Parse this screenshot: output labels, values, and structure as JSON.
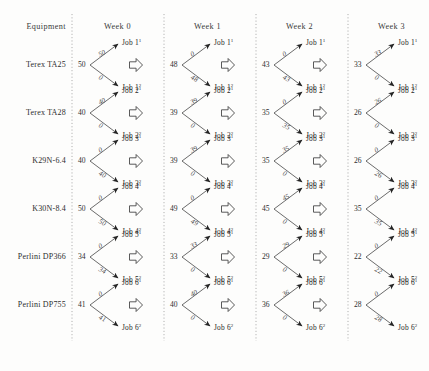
{
  "figure": {
    "type": "multi-stage-allocation-diagram",
    "columns": [
      "Equipment",
      "Week 0",
      "Week 1",
      "Week 2",
      "Week 3"
    ],
    "equipment_header": "Equipment",
    "week_headers": [
      "Week 0",
      "Week 1",
      "Week 2",
      "Week 3"
    ],
    "separator_style": "vertical-dotted-line",
    "transition_glyph": "pentagon-arrow"
  },
  "rows": [
    {
      "equipment": "Terex TA25",
      "jobs": {
        "top": "Job 1",
        "top_sup": "1",
        "bottom": "Job 1",
        "bottom_sup": "2"
      },
      "weeks": [
        {
          "label": "Week 0",
          "value": "50",
          "edge_top": "50",
          "edge_bottom": "0"
        },
        {
          "label": "Week 1",
          "value": "48",
          "edge_top": "0",
          "edge_bottom": "48"
        },
        {
          "label": "Week 2",
          "value": "43",
          "edge_top": "0",
          "edge_bottom": "43"
        },
        {
          "label": "Week 3",
          "value": "33",
          "edge_top": "33",
          "edge_bottom": "0"
        }
      ]
    },
    {
      "equipment": "Terex TA28",
      "jobs": {
        "top": "Job 2",
        "top_sup": "1",
        "bottom": "Job 2",
        "bottom_sup": "2"
      },
      "weeks": [
        {
          "label": "Week 0",
          "value": "40",
          "edge_top": "40",
          "edge_bottom": "0"
        },
        {
          "label": "Week 1",
          "value": "39",
          "edge_top": "39",
          "edge_bottom": "0"
        },
        {
          "label": "Week 2",
          "value": "35",
          "edge_top": "0",
          "edge_bottom": "35"
        },
        {
          "label": "Week 3",
          "value": "26",
          "edge_top": "26",
          "edge_bottom": "0"
        }
      ]
    },
    {
      "equipment": "K29N-6.4",
      "jobs": {
        "top": "Job 3",
        "top_sup": "1",
        "bottom": "Job 3",
        "bottom_sup": "2"
      },
      "weeks": [
        {
          "label": "Week 0",
          "value": "40",
          "edge_top": "0",
          "edge_bottom": "40"
        },
        {
          "label": "Week 1",
          "value": "39",
          "edge_top": "39",
          "edge_bottom": "0"
        },
        {
          "label": "Week 2",
          "value": "35",
          "edge_top": "35",
          "edge_bottom": "0"
        },
        {
          "label": "Week 3",
          "value": "26",
          "edge_top": "0",
          "edge_bottom": "26"
        }
      ]
    },
    {
      "equipment": "K30N-8.4",
      "jobs": {
        "top": "Job 4",
        "top_sup": "1",
        "bottom": "Job 4",
        "bottom_sup": "2"
      },
      "weeks": [
        {
          "label": "Week 0",
          "value": "50",
          "edge_top": "0",
          "edge_bottom": "50"
        },
        {
          "label": "Week 1",
          "value": "49",
          "edge_top": "0",
          "edge_bottom": "49"
        },
        {
          "label": "Week 2",
          "value": "45",
          "edge_top": "45",
          "edge_bottom": "0"
        },
        {
          "label": "Week 3",
          "value": "35",
          "edge_top": "0",
          "edge_bottom": "35"
        }
      ]
    },
    {
      "equipment": "Perlini DP366",
      "jobs": {
        "top": "Job 5",
        "top_sup": "1",
        "bottom": "Job 5",
        "bottom_sup": "2"
      },
      "weeks": [
        {
          "label": "Week 0",
          "value": "34",
          "edge_top": "0",
          "edge_bottom": "34"
        },
        {
          "label": "Week 1",
          "value": "33",
          "edge_top": "33",
          "edge_bottom": "0"
        },
        {
          "label": "Week 2",
          "value": "29",
          "edge_top": "29",
          "edge_bottom": "0"
        },
        {
          "label": "Week 3",
          "value": "22",
          "edge_top": "0",
          "edge_bottom": "22"
        }
      ]
    },
    {
      "equipment": "Perlini DP755",
      "jobs": {
        "top": "Job 6",
        "top_sup": "1",
        "bottom": "Job 6",
        "bottom_sup": "2"
      },
      "weeks": [
        {
          "label": "Week 0",
          "value": "41",
          "edge_top": "0",
          "edge_bottom": "41"
        },
        {
          "label": "Week 1",
          "value": "40",
          "edge_top": "40",
          "edge_bottom": "0"
        },
        {
          "label": "Week 2",
          "value": "36",
          "edge_top": "36",
          "edge_bottom": "0"
        },
        {
          "label": "Week 3",
          "value": "28",
          "edge_top": "0",
          "edge_bottom": "28"
        }
      ]
    }
  ]
}
